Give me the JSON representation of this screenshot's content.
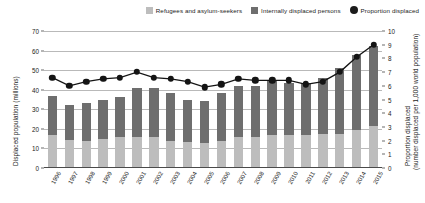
{
  "legend": {
    "items": [
      {
        "label": "Refugees and asylum-seekers",
        "marker": "square-swatch",
        "color": "#bdbdbd"
      },
      {
        "label": "Internally displaced persons",
        "marker": "square-swatch",
        "color": "#6e6e6e"
      },
      {
        "label": "Proportion displaced",
        "marker": "circle-dot",
        "color": "#1b1b1b"
      }
    ]
  },
  "axes": {
    "y_left_title": "Displaced population (millions)",
    "y_right_title_line1": "Proportion displaced",
    "y_right_title_line2": "(number displaced per 1,000 world population)",
    "y_left_ticks": [
      "0",
      "10",
      "20",
      "30",
      "40",
      "50",
      "60",
      "70"
    ],
    "y_right_ticks": [
      "0",
      "1",
      "2",
      "3",
      "4",
      "5",
      "6",
      "7",
      "8",
      "9",
      "10"
    ]
  },
  "chart_data": {
    "type": "bar",
    "title": "",
    "subtitle": "",
    "xlabel": "",
    "ylabel": "Displaced population (millions)",
    "y2label": "Proportion displaced (number displaced per 1,000 world population)",
    "ylim": [
      0,
      70
    ],
    "y2lim": [
      0,
      10
    ],
    "grid": true,
    "legend_position": "top-right",
    "stacked": true,
    "categories": [
      "1996",
      "1997",
      "1998",
      "1999",
      "2000",
      "2001",
      "2002",
      "2003",
      "2004",
      "2005",
      "2006",
      "2007",
      "2008",
      "2009",
      "2010",
      "2011",
      "2012",
      "2013",
      "2014",
      "2015"
    ],
    "series": [
      {
        "name": "Refugees and asylum-seekers",
        "type": "bar",
        "color": "#bdbdbd",
        "axis": "left",
        "values": [
          17.0,
          14.5,
          14.0,
          15.0,
          16.0,
          16.0,
          16.0,
          14.0,
          13.5,
          13.0,
          14.0,
          16.0,
          16.0,
          17.0,
          17.0,
          17.0,
          17.5,
          17.5,
          19.5,
          21.5
        ]
      },
      {
        "name": "Internally displaced persons",
        "type": "bar",
        "color": "#6e6e6e",
        "axis": "left",
        "values": [
          20.0,
          17.5,
          19.0,
          20.0,
          20.5,
          25.0,
          25.0,
          24.5,
          21.5,
          21.0,
          24.5,
          26.0,
          26.0,
          27.5,
          26.5,
          26.5,
          28.5,
          33.5,
          38.0,
          41.0
        ]
      },
      {
        "name": "Proportion displaced",
        "type": "line",
        "color": "#141414",
        "axis": "right",
        "marker": "circle",
        "values": [
          6.6,
          6.0,
          6.3,
          6.5,
          6.6,
          7.0,
          6.6,
          6.5,
          6.3,
          5.9,
          6.1,
          6.5,
          6.4,
          6.4,
          6.4,
          6.1,
          6.3,
          7.0,
          8.1,
          9.0
        ]
      }
    ]
  }
}
